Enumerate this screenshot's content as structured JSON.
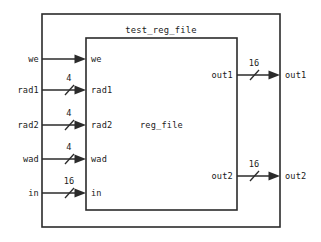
{
  "diagram": {
    "type": "block-diagram",
    "title": "test_reg_file",
    "inner_module": "reg_file",
    "background_color": "#ffffff",
    "line_color": "#2b2b2b",
    "outer_box": {
      "x": 42,
      "y": 14,
      "width": 238,
      "height": 213
    },
    "inner_box": {
      "x": 86,
      "y": 38,
      "width": 151,
      "height": 172
    },
    "inputs": [
      {
        "name": "we",
        "port": "we",
        "width": "",
        "y": 59,
        "has_bus_tick": false
      },
      {
        "name": "rad1",
        "port": "rad1",
        "width": "4",
        "y": 90,
        "has_bus_tick": true
      },
      {
        "name": "rad2",
        "port": "rad2",
        "width": "4",
        "y": 125,
        "has_bus_tick": true
      },
      {
        "name": "wad",
        "port": "wad",
        "width": "4",
        "y": 159,
        "has_bus_tick": true
      },
      {
        "name": "in",
        "port": "in",
        "width": "16",
        "y": 193,
        "has_bus_tick": true
      }
    ],
    "outputs": [
      {
        "name": "out1",
        "port": "out1",
        "width": "16",
        "y": 75,
        "has_bus_tick": true
      },
      {
        "name": "out2",
        "port": "out2",
        "width": "16",
        "y": 176,
        "has_bus_tick": true
      }
    ]
  }
}
